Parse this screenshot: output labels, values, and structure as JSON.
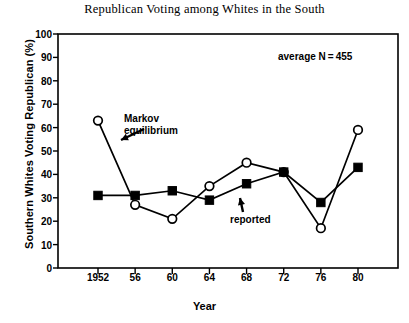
{
  "chart_data": {
    "type": "line",
    "title": "Republican Voting among Whites in the South",
    "xlabel": "Year",
    "ylabel": "Southern Whites Voting Republican (%)",
    "x": [
      1952,
      1956,
      1960,
      1964,
      1968,
      1972,
      1976,
      1980
    ],
    "xtick_labels": [
      "1952",
      "56",
      "60",
      "64",
      "68",
      "72",
      "76",
      "80"
    ],
    "ytick_labels": [
      "0",
      "10",
      "20",
      "30",
      "40",
      "50",
      "60",
      "70",
      "80",
      "90",
      "100"
    ],
    "ylim": [
      0,
      100
    ],
    "ytick_step": 10,
    "grid": false,
    "legend": "none",
    "series": [
      {
        "name": "Markov equilibrium",
        "marker": "open-circle",
        "values": [
          63,
          27,
          21,
          35,
          45,
          41,
          17,
          59
        ]
      },
      {
        "name": "reported",
        "marker": "filled-square",
        "values": [
          31,
          31,
          33,
          29,
          36,
          41,
          28,
          43
        ]
      }
    ],
    "annotations": [
      {
        "text_line1": "Markov",
        "text_line2": "equilibrium",
        "arrow": "down-left"
      },
      {
        "text_line1": "reported",
        "text_line2": "",
        "arrow": "up"
      },
      {
        "text_line1": "average N = 455",
        "text_line2": "",
        "arrow": "none"
      }
    ]
  },
  "colors": {
    "axis": "#000000",
    "series1": "#000000",
    "series2": "#000000",
    "background": "#ffffff"
  }
}
